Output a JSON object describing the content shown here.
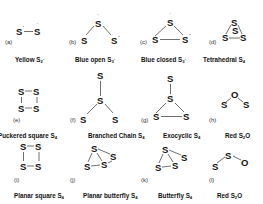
{
  "figure": {
    "panels": [
      {
        "tag": "(a)",
        "name": "Yellow S",
        "sub": "2",
        "sup": "-"
      },
      {
        "tag": "(b)",
        "name": "Blue open S",
        "sub": "3",
        "sup": "-"
      },
      {
        "tag": "(c)",
        "name": "Blue closed S",
        "sub": "3",
        "sup": "-"
      },
      {
        "tag": "(d)",
        "name": "Tetrahedral S",
        "sub": "4",
        "sup": ""
      },
      {
        "tag": "(e)",
        "name": "Puckered square S",
        "sub": "4",
        "sup": ""
      },
      {
        "tag": "(f)",
        "name": "Branched Chain S",
        "sub": "4",
        "sup": ""
      },
      {
        "tag": "(g)",
        "name": "Exocyclic S",
        "sub": "4",
        "sup": ""
      },
      {
        "tag": "(h)",
        "name": "Red S",
        "sub": "2",
        "sup": "",
        "suffix": "O"
      },
      {
        "tag": "(i)",
        "name": "Planar square S",
        "sub": "4",
        "sup": ""
      },
      {
        "tag": "(j)",
        "name": "Planar butterfly S",
        "sub": "4",
        "sup": ""
      },
      {
        "tag": "(k)",
        "name": "Butterfly S",
        "sub": "4",
        "sup": ""
      },
      {
        "tag": "(l)",
        "name": "Red S",
        "sub": "2",
        "sup": "",
        "suffix": "O"
      }
    ],
    "atoms": {
      "sulfur": "S",
      "oxygen": "O",
      "minus": "-",
      "radical": "·"
    }
  }
}
